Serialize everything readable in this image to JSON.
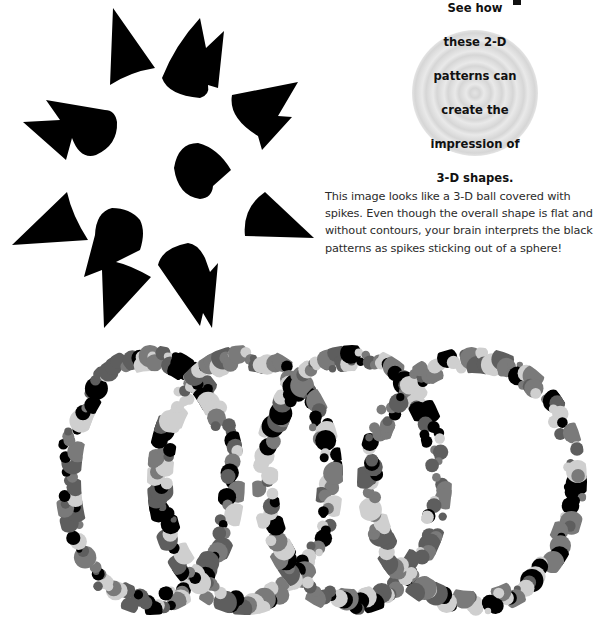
{
  "page": {
    "callout": {
      "lines": [
        "See how",
        "these 2-D",
        "patterns can",
        "create the",
        "impression of",
        "3-D shapes."
      ]
    },
    "body_text": "This image looks like a 3-D ball covered with spikes. Even though the overall shape is flat and without contours, your brain interprets the black patterns as spikes sticking out of a sphere!",
    "figures": {
      "spiky_ball": {
        "description": "flat black shapes arranged to suggest a 3-D ball covered with spikes",
        "color": "#000000"
      },
      "dotted_rings": {
        "description": "four overlapping rings made of grey and black dots",
        "count": 4,
        "dot_colors": [
          "#000000",
          "#5e5e5e",
          "#7a7a7a",
          "#cfcfcf"
        ]
      }
    }
  }
}
